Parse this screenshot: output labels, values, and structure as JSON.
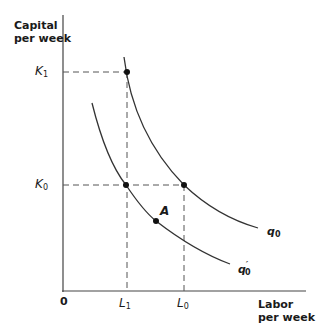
{
  "diagram": {
    "y_axis": {
      "label_line1": "Capital",
      "label_line2": "per week"
    },
    "x_axis": {
      "label_line1": "Labor",
      "label_line2": "per week"
    },
    "origin": "0",
    "y_ticks": [
      {
        "base": "K",
        "sub": "1"
      },
      {
        "base": "K",
        "sub": "0"
      }
    ],
    "x_ticks": [
      {
        "base": "L",
        "sub": "1"
      },
      {
        "base": "L",
        "sub": "0"
      }
    ],
    "curves": [
      {
        "name": "q0",
        "base": "q",
        "sub": "0",
        "prime": ""
      },
      {
        "name": "q'0",
        "base": "q",
        "sub": "0",
        "prime": "′"
      }
    ],
    "points": [
      {
        "label": "",
        "at": "(L1, K1) on q0"
      },
      {
        "label": "",
        "at": "(L0, K0) on q0"
      },
      {
        "label": "",
        "at": "(L1, K0) on q'0"
      },
      {
        "label": "A",
        "at": "on q'0"
      }
    ],
    "colors": {
      "line": "#333333",
      "dash": "#555555",
      "point": "#111111"
    }
  }
}
